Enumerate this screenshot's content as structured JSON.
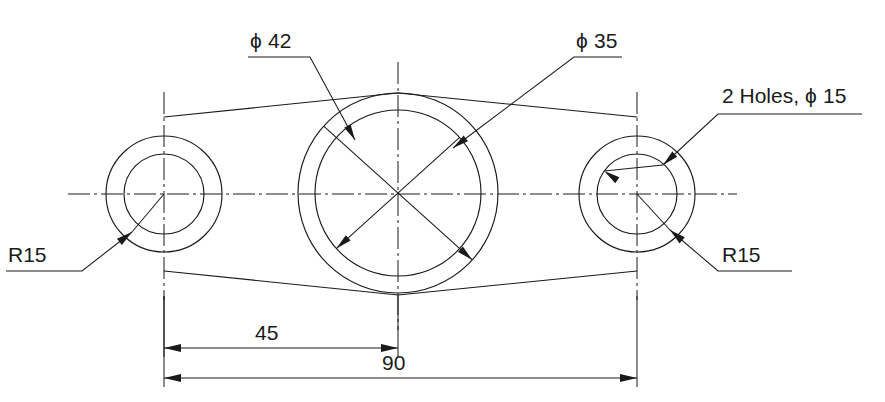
{
  "drawing": {
    "title": "Three-circle bearing plate outline drawing",
    "units_note": "",
    "background_color": "#ffffff",
    "line_color": "#1a1a1a"
  },
  "annotations": {
    "phi42": {
      "label": "42",
      "symbol": "ϕ",
      "full_text": "ϕ 42",
      "text_x": 250,
      "text_y": 48,
      "shelf_x1": 248,
      "shelf_x2": 310,
      "shelf_y": 57,
      "leader_x2": 355,
      "leader_y2": 140,
      "arrow_tip_x": 355,
      "arrow_tip_y": 140
    },
    "phi35": {
      "label": "35",
      "symbol": "ϕ",
      "full_text": "ϕ 35",
      "text_x": 576,
      "text_y": 48,
      "shelf_x1": 574,
      "shelf_x2": 622,
      "shelf_y": 57,
      "arrow_tip_x": 453,
      "arrow_tip_y": 148
    },
    "two_holes": {
      "full_text": "2 Holes, ϕ 15",
      "prefix": "2 Holes,",
      "symbol": "ϕ",
      "value": "15",
      "text_x": 722,
      "text_y": 103,
      "shelf_x1": 718,
      "shelf_x2": 862,
      "shelf_y": 114,
      "arrow_tip_x": 663,
      "arrow_tip_y": 165
    },
    "r15_left": {
      "label": "R15",
      "text_x": 8,
      "text_y": 262,
      "shelf_x1": 6,
      "shelf_x2": 82,
      "shelf_y": 271,
      "arrow_tip_x": 132,
      "arrow_tip_y": 232
    },
    "r15_right": {
      "label": "R15",
      "text_x": 722,
      "text_y": 262,
      "shelf_x1": 718,
      "shelf_x2": 792,
      "shelf_y": 271,
      "arrow_tip_x": 670,
      "arrow_tip_y": 230
    }
  },
  "dimensions": [
    {
      "name": "dim-45",
      "value": "45",
      "from_x": 164,
      "to_x": 398,
      "line_y": 348,
      "text_x": 255,
      "text_y": 340
    },
    {
      "name": "dim-90",
      "value": "90",
      "from_x": 164,
      "to_x": 637,
      "line_y": 378,
      "text_x": 382,
      "text_y": 370
    }
  ],
  "geometry": {
    "centerline_y": 194,
    "centerline_x1": 68,
    "centerline_x2": 737,
    "circles": [
      {
        "name": "left-boss",
        "cx": 164,
        "cy": 194,
        "outer_r": 58,
        "inner_r": 40,
        "vline_top": 92,
        "vline_bottom": 300
      },
      {
        "name": "center-boss",
        "cx": 398,
        "cy": 193,
        "outer_r": 100,
        "inner_r": 83,
        "vline_top": 62,
        "vline_bottom": 330
      },
      {
        "name": "right-boss",
        "cx": 637,
        "cy": 194,
        "outer_r": 58,
        "inner_r": 40,
        "vline_top": 92,
        "vline_bottom": 300
      }
    ],
    "tangents": [
      {
        "name": "top-left-tangent",
        "x1": 164,
        "y1": 117,
        "x2": 398,
        "y2": 93
      },
      {
        "name": "top-right-tangent",
        "x1": 398,
        "y1": 93,
        "x2": 637,
        "y2": 117
      },
      {
        "name": "bottom-left-tangent",
        "x1": 164,
        "y1": 271,
        "x2": 398,
        "y2": 295
      },
      {
        "name": "bottom-right-tangent",
        "x1": 398,
        "y1": 295,
        "x2": 637,
        "y2": 271
      }
    ]
  },
  "chart_data": {
    "type": "table",
    "categories": [
      "ϕ 42",
      "ϕ 35",
      "2 Holes, ϕ 15",
      "R15",
      "R15",
      "45",
      "90"
    ],
    "values": [
      42,
      35,
      15,
      15,
      15,
      45,
      90
    ],
    "xlabel": "Feature",
    "ylabel": "Dimension (mm)"
  }
}
